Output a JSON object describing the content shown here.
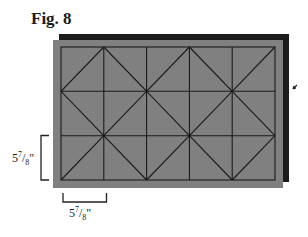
{
  "figure": {
    "title": "Fig. 8"
  },
  "diagram": {
    "grid": {
      "columns": 5,
      "rows": 3
    },
    "colors": {
      "back_panel": "#1c1c1c",
      "front_panel": "#808080",
      "grid_line": "#1a1a1a",
      "bracket": "#222222"
    }
  },
  "dimensions": {
    "vertical": {
      "whole": "5",
      "num": "7",
      "den": "8",
      "unit": "\""
    },
    "horizontal": {
      "whole": "5",
      "num": "7",
      "den": "8",
      "unit": "\""
    }
  }
}
